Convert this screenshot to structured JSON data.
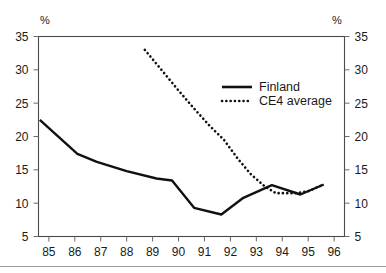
{
  "chart_data": {
    "type": "line",
    "title": "",
    "xlabel": "",
    "ylabel": "",
    "left_axis_unit": "%",
    "right_axis_unit": "%",
    "grid": false,
    "legend_position": "inside-top-right",
    "x": [
      85,
      86,
      87,
      88,
      89,
      90,
      91,
      92,
      93,
      94,
      95,
      96
    ],
    "xlim": [
      84.6,
      96.4
    ],
    "ylim": [
      5,
      35
    ],
    "xtick_labels": [
      "85",
      "86",
      "87",
      "88",
      "89",
      "90",
      "91",
      "92",
      "93",
      "94",
      "95",
      "96"
    ],
    "ytick_labels": [
      "35",
      "30",
      "25",
      "20",
      "15",
      "10",
      "5"
    ],
    "ytick_values": [
      35,
      30,
      25,
      20,
      15,
      10,
      5
    ],
    "series": [
      {
        "name": "Finland",
        "style": "solid",
        "color": "#111111",
        "x": [
          84.65,
          86.1,
          86.85,
          88.0,
          89.15,
          89.75,
          90.6,
          91.65,
          92.5,
          93.6,
          94.7,
          95.6
        ],
        "values": [
          22.5,
          17.4,
          16.2,
          14.8,
          13.7,
          13.4,
          9.3,
          8.3,
          10.8,
          12.7,
          11.3,
          12.8
        ]
      },
      {
        "name": "CE4 average",
        "style": "dotted",
        "color": "#111111",
        "x": [
          88.7,
          89.3,
          90.0,
          90.6,
          91.2,
          91.75,
          92.3,
          92.8,
          93.3,
          93.75,
          94.55,
          95.0,
          95.6
        ],
        "values": [
          33.0,
          30.2,
          26.9,
          24.2,
          21.6,
          19.5,
          16.6,
          14.3,
          12.6,
          11.5,
          11.5,
          11.8,
          12.8
        ]
      }
    ]
  },
  "legend": {
    "entries": [
      {
        "label": "Finland",
        "style": "solid"
      },
      {
        "label": "CE4 average",
        "style": "dotted"
      }
    ]
  }
}
